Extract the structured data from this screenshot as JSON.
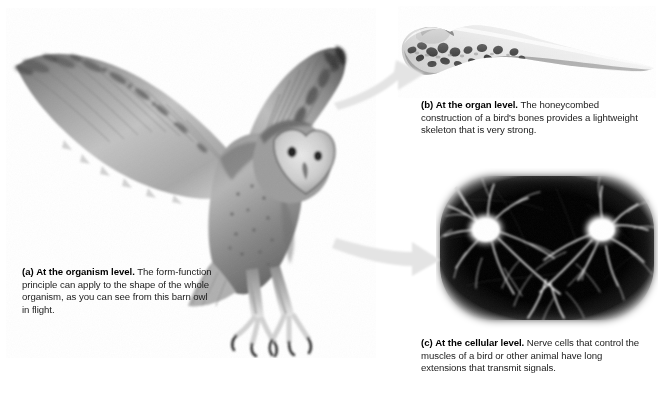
{
  "figure": {
    "background_color": "#ffffff",
    "arrow_color": "#e2e2e2",
    "panels": [
      {
        "id": "a",
        "label": "(a)",
        "lead": "At the organism level.",
        "body": " The form-function principle can apply to the shape of the whole organism, as you can see from this barn owl in flight.",
        "subject": "barn-owl-in-flight-photograph"
      },
      {
        "id": "b",
        "label": "(b)",
        "lead": "At the organ level.",
        "body": " The honeycombed construction of a bird's bones provides a lightweight skeleton that is very strong.",
        "subject": "sectioned-bird-bone-photograph"
      },
      {
        "id": "c",
        "label": "(c)",
        "lead": "At the cellular level.",
        "body": " Nerve cells that control the muscles of a bird or other animal have long extensions that transmit signals.",
        "subject": "nerve-cell-micrograph"
      }
    ]
  }
}
